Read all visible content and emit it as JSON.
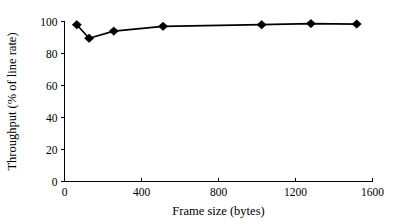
{
  "chart_data": {
    "type": "line",
    "title": "",
    "xlabel": "Frame size (bytes)",
    "ylabel": "Throughput (% of line rate)",
    "xlim": [
      0,
      1600
    ],
    "ylim": [
      0,
      100
    ],
    "xticks": [
      0,
      400,
      800,
      1200,
      1600
    ],
    "yticks": [
      0,
      20,
      40,
      60,
      80,
      100
    ],
    "xtick_labels": [
      "0",
      "400",
      "800",
      "1200",
      "1600"
    ],
    "ytick_labels": [
      "0",
      "20",
      "40",
      "60",
      "80",
      "100"
    ],
    "grid": false,
    "legend": false,
    "marker": "diamond",
    "marker_color": "#000000",
    "line_color": "#000000",
    "x": [
      64,
      128,
      256,
      512,
      1024,
      1280,
      1518
    ],
    "values": [
      98.0,
      89.5,
      94.0,
      97.0,
      98.0,
      98.7,
      98.4
    ],
    "series": [
      {
        "name": "Throughput",
        "x": [
          64,
          128,
          256,
          512,
          1024,
          1280,
          1518
        ],
        "values": [
          98.0,
          89.5,
          94.0,
          97.0,
          98.0,
          98.7,
          98.4
        ]
      }
    ]
  }
}
